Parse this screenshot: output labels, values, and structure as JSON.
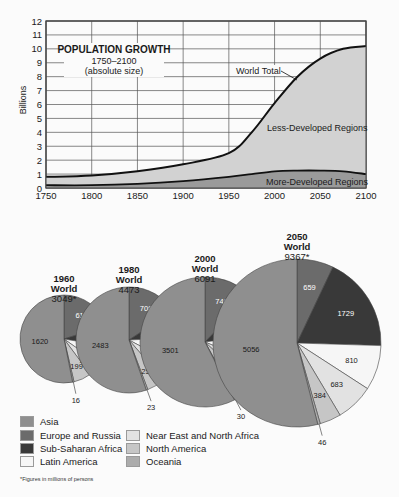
{
  "chart_data": [
    {
      "type": "area",
      "title": "POPULATION GROWTH",
      "subtitle": "1750–2100",
      "subtitle2": "(absolute size)",
      "xlabel": "",
      "ylabel": "Billions",
      "xlim": [
        1750,
        2100
      ],
      "ylim": [
        0,
        12
      ],
      "grid": true,
      "x_ticks": [
        "1750",
        "1800",
        "1850",
        "1900",
        "1950",
        "2000",
        "2050",
        "2100"
      ],
      "y_ticks": [
        "0",
        "1",
        "2",
        "3",
        "4",
        "5",
        "6",
        "7",
        "8",
        "9",
        "10",
        "11",
        "12"
      ],
      "x": [
        1750,
        1800,
        1850,
        1900,
        1950,
        1975,
        2000,
        2025,
        2050,
        2075,
        2100
      ],
      "series": [
        {
          "name": "More-Developed Regions",
          "values": [
            0.2,
            0.2,
            0.3,
            0.5,
            0.8,
            1.0,
            1.2,
            1.25,
            1.25,
            1.2,
            1.0
          ]
        },
        {
          "name": "World Total",
          "values": [
            0.8,
            0.9,
            1.2,
            1.7,
            2.5,
            4.0,
            6.1,
            8.0,
            9.3,
            10.0,
            10.2
          ]
        }
      ],
      "annotations": [
        "World Total",
        "Less-Developed Regions",
        "More-Developed Regions"
      ]
    },
    {
      "type": "pie",
      "title": "Population by region (millions)",
      "categories": [
        "Europe and Russia",
        "Sub-Saharan Africa",
        "Latin America",
        "Near East and North Africa",
        "North America",
        "Oceania",
        "Asia"
      ],
      "pies": [
        {
          "year": "1960",
          "label": "World",
          "total": "3049*",
          "values": [
            615,
            227,
            218,
            154,
            199,
            16,
            1620
          ]
        },
        {
          "year": "1980",
          "label": "World",
          "total": "4473",
          "values": [
            708,
            381,
            384,
            262,
            252,
            23,
            2483
          ]
        },
        {
          "year": "2000",
          "label": "World",
          "total": "6091",
          "values": [
            746,
            645,
            515,
            346,
            308,
            30,
            3501
          ]
        },
        {
          "year": "2050",
          "label": "World",
          "total": "9367*",
          "values": [
            659,
            1729,
            810,
            683,
            384,
            46,
            5056
          ]
        }
      ],
      "legend": [
        {
          "label": "Asia",
          "color": "#8f8f8f"
        },
        {
          "label": "Europe and Russia",
          "color": "#6b6b6b"
        },
        {
          "label": "Sub-Saharan Africa",
          "color": "#393939"
        },
        {
          "label": "Latin America",
          "color": "#f6f6f6"
        },
        {
          "label": "Near East and North Africa",
          "color": "#e2e2e2"
        },
        {
          "label": "North America",
          "color": "#c6c6c6"
        },
        {
          "label": "Oceania",
          "color": "#acacac"
        }
      ],
      "footnote": "*Figures in millions of persons"
    }
  ],
  "colors": {
    "less_developed_fill": "#d2d2d2",
    "more_developed_fill": "#9a9a9a",
    "grid": "#555555",
    "line": "#111111"
  }
}
